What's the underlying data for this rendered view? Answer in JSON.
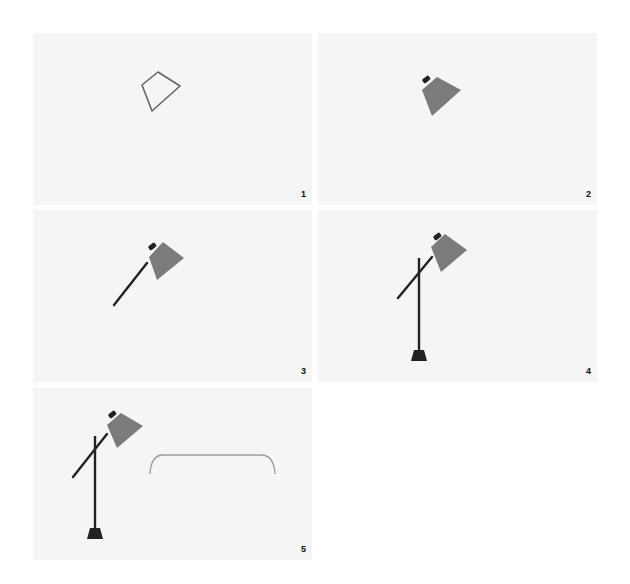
{
  "figure": {
    "colors": {
      "background": "#ffffff",
      "panel": "#f5f5f5",
      "outline": "#666666",
      "shade": "#7b7b7b",
      "metal": "#222222",
      "table_outline": "#9a9a9a"
    },
    "panels": [
      {
        "step": "1",
        "content": "lampshade-outline"
      },
      {
        "step": "2",
        "content": "filled-lampshade"
      },
      {
        "step": "3",
        "content": "lampshade-with-arm"
      },
      {
        "step": "4",
        "content": "lamp-with-pole-and-base"
      },
      {
        "step": "5",
        "content": "lamp-with-table-outline"
      }
    ]
  }
}
